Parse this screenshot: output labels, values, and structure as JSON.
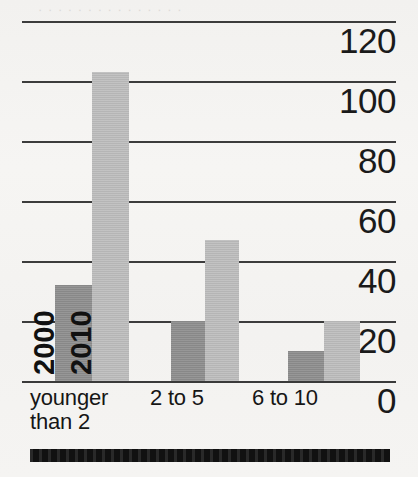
{
  "chart_data": {
    "type": "bar",
    "title": "",
    "xlabel": "",
    "ylabel": "",
    "categories": [
      "younger\nthan 2",
      "2 to 5",
      "6 to 10"
    ],
    "series": [
      {
        "name": "2000",
        "color": "#8f8f8f",
        "values": [
          32,
          20,
          10
        ]
      },
      {
        "name": "2010",
        "color": "#bcbcbc",
        "values": [
          103,
          47,
          20
        ]
      }
    ],
    "ylim": [
      0,
      120
    ],
    "yticks": [
      120,
      100,
      80,
      60,
      40,
      20,
      0
    ],
    "ytick_labels": [
      "120",
      "100",
      "80",
      "60",
      "40",
      "20",
      "0"
    ],
    "grid": true,
    "grid_axis": "y",
    "legend_position": "in-bar-rotated",
    "tick_label_side": "right"
  },
  "axis": {
    "y_labels": [
      "120",
      "100",
      "80",
      "60",
      "40",
      "20",
      "0"
    ]
  },
  "categories": [
    {
      "label": "younger\nthan 2"
    },
    {
      "label": "2 to 5"
    },
    {
      "label": "6 to 10"
    }
  ],
  "series_tags": [
    {
      "label": "2000"
    },
    {
      "label": "2010"
    }
  ],
  "artifacts": {
    "bleed_text": "· · · · · · · · · · · · · · ·"
  }
}
